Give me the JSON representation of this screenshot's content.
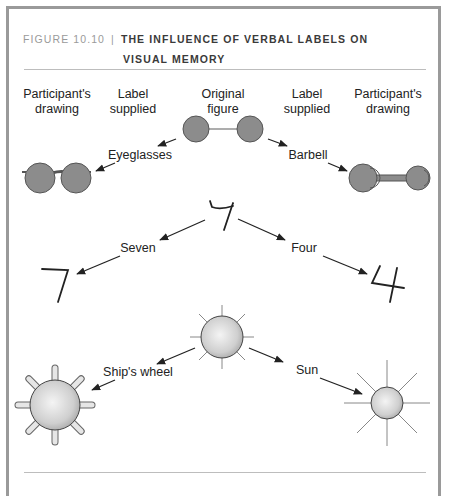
{
  "caption": {
    "figure_number": "FIGURE 10.10",
    "separator": "|",
    "title_line1": "THE INFLUENCE OF VERBAL LABELS ON",
    "title_line2": "VISUAL MEMORY"
  },
  "column_headers": {
    "left_drawing": [
      "Participant's",
      "drawing"
    ],
    "left_label": [
      "Label",
      "supplied"
    ],
    "original": [
      "Original",
      "figure"
    ],
    "right_label": [
      "Label",
      "supplied"
    ],
    "right_drawing": [
      "Participant's",
      "drawing"
    ]
  },
  "rows": [
    {
      "original": "two circles joined by a line",
      "left_label": "Eyeglasses",
      "left_drawing": "eyeglasses",
      "right_label": "Barbell",
      "right_drawing": "barbell"
    },
    {
      "original": "ambiguous 4/7 figure",
      "left_label": "Seven",
      "left_drawing": "7",
      "right_label": "Four",
      "right_drawing": "4"
    },
    {
      "original": "circle with rays",
      "left_label": "Ship's wheel",
      "left_drawing": "ship's wheel",
      "right_label": "Sun",
      "right_drawing": "sun"
    }
  ],
  "colors": {
    "frame": "#9a9a9a",
    "fill_dark": "#8a8a8a",
    "stroke": "#444444"
  }
}
